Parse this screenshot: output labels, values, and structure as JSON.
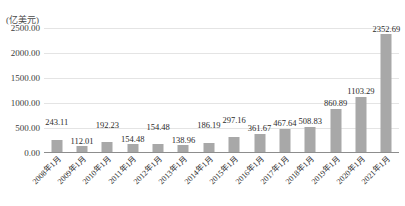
{
  "chart_data": {
    "type": "bar",
    "title": "",
    "subtitle": "",
    "xlabel": "",
    "ylabel": "(亿美元)",
    "ylim": [
      0,
      2500
    ],
    "yticks": [
      "0.00",
      "500.00",
      "1000.00",
      "1500.00",
      "2000.00",
      "2500.00"
    ],
    "ytick_values": [
      0,
      500,
      1000,
      1500,
      2000,
      2500
    ],
    "grid": true,
    "legend": false,
    "bar_color": "#a8a8a8",
    "gridline_color": "#e4e4e4",
    "axis_color": "#8d8d8d",
    "categories": [
      "2008年1月",
      "2009年1月",
      "2010年1月",
      "2011年1月",
      "2012年1月",
      "2013年1月",
      "2014年1月",
      "2015年1月",
      "2016年1月",
      "2017年1月",
      "2018年1月",
      "2019年1月",
      "2020年1月",
      "2021年1月"
    ],
    "values": [
      243.11,
      112.01,
      192.23,
      154.48,
      154.48,
      138.96,
      186.19,
      297.16,
      361.67,
      467.64,
      508.83,
      860.89,
      1103.29,
      2352.69
    ],
    "value_labels": [
      "243.11",
      "112.01",
      "192.23",
      "154.48",
      "154.48",
      "138.96",
      "186.19",
      "297.16",
      "361.67",
      "467.64",
      "508.83",
      "860.89",
      "1103.29",
      "2352.69"
    ],
    "label_offsets_px": [
      24,
      12,
      24,
      12,
      24,
      12,
      24,
      24,
      12,
      12,
      12,
      12,
      12,
      12
    ]
  }
}
